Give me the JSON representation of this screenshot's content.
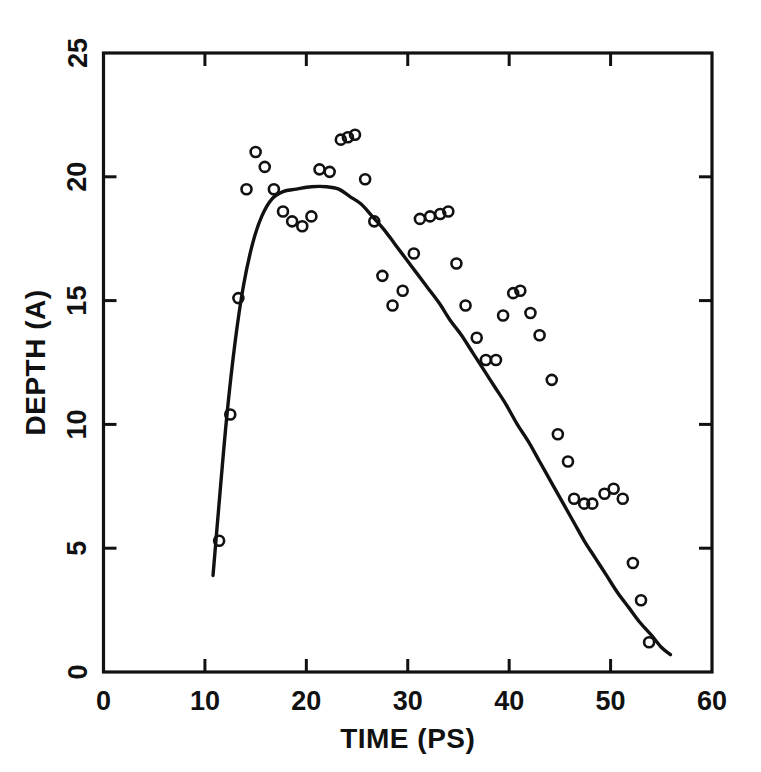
{
  "chart_data": {
    "type": "scatter",
    "title": "",
    "subtitle": "",
    "xlabel": "TIME (PS)",
    "ylabel": "DEPTH (A)",
    "xlim": [
      0,
      60
    ],
    "ylim": [
      0,
      25
    ],
    "xticks": [
      0,
      10,
      20,
      30,
      40,
      50,
      60
    ],
    "xtick_labels": [
      "0",
      "10",
      "20",
      "30",
      "40",
      "50",
      "60"
    ],
    "yticks": [
      0,
      5,
      10,
      15,
      20,
      25
    ],
    "ytick_labels": [
      "0",
      "5",
      "10",
      "15",
      "20",
      "25"
    ],
    "grid": false,
    "legend": null,
    "frame": "box",
    "tick_direction": "in",
    "marker": "open-circle",
    "series": [
      {
        "name": "measured depth",
        "type": "scatter",
        "marker": "open-circle",
        "points": [
          [
            11.4,
            5.3
          ],
          [
            12.5,
            10.4
          ],
          [
            13.3,
            15.1
          ],
          [
            14.1,
            19.5
          ],
          [
            15.0,
            21.0
          ],
          [
            15.9,
            20.4
          ],
          [
            16.8,
            19.5
          ],
          [
            17.7,
            18.6
          ],
          [
            18.6,
            18.2
          ],
          [
            19.6,
            18.0
          ],
          [
            20.5,
            18.4
          ],
          [
            21.3,
            20.3
          ],
          [
            22.3,
            20.2
          ],
          [
            23.4,
            21.5
          ],
          [
            24.1,
            21.6
          ],
          [
            24.8,
            21.7
          ],
          [
            25.8,
            19.9
          ],
          [
            26.7,
            18.2
          ],
          [
            27.5,
            16.0
          ],
          [
            28.5,
            14.8
          ],
          [
            29.5,
            15.4
          ],
          [
            30.6,
            16.9
          ],
          [
            31.2,
            18.3
          ],
          [
            32.2,
            18.4
          ],
          [
            33.2,
            18.5
          ],
          [
            34.0,
            18.6
          ],
          [
            34.8,
            16.5
          ],
          [
            35.7,
            14.8
          ],
          [
            36.8,
            13.5
          ],
          [
            37.7,
            12.6
          ],
          [
            38.7,
            12.6
          ],
          [
            39.4,
            14.4
          ],
          [
            40.4,
            15.3
          ],
          [
            41.1,
            15.4
          ],
          [
            42.1,
            14.5
          ],
          [
            43.0,
            13.6
          ],
          [
            44.2,
            11.8
          ],
          [
            44.8,
            9.6
          ],
          [
            45.8,
            8.5
          ],
          [
            46.4,
            7.0
          ],
          [
            47.4,
            6.8
          ],
          [
            48.2,
            6.8
          ],
          [
            49.4,
            7.2
          ],
          [
            50.3,
            7.4
          ],
          [
            51.2,
            7.0
          ],
          [
            52.2,
            4.4
          ],
          [
            53.0,
            2.9
          ],
          [
            53.8,
            1.2
          ]
        ]
      },
      {
        "name": "fitted curve",
        "type": "line",
        "points": [
          [
            10.8,
            3.9
          ],
          [
            11.5,
            7.3
          ],
          [
            12.2,
            10.5
          ],
          [
            13.0,
            13.4
          ],
          [
            13.8,
            15.6
          ],
          [
            14.7,
            17.3
          ],
          [
            15.6,
            18.4
          ],
          [
            16.6,
            19.1
          ],
          [
            17.7,
            19.4
          ],
          [
            19.0,
            19.5
          ],
          [
            20.5,
            19.6
          ],
          [
            22.0,
            19.6
          ],
          [
            23.2,
            19.5
          ],
          [
            24.3,
            19.2
          ],
          [
            25.4,
            18.9
          ],
          [
            26.5,
            18.4
          ],
          [
            27.6,
            17.9
          ],
          [
            28.7,
            17.3
          ],
          [
            29.8,
            16.7
          ],
          [
            30.9,
            16.1
          ],
          [
            32.0,
            15.5
          ],
          [
            33.1,
            14.9
          ],
          [
            34.2,
            14.2
          ],
          [
            35.3,
            13.6
          ],
          [
            36.4,
            12.9
          ],
          [
            37.5,
            12.2
          ],
          [
            38.6,
            11.5
          ],
          [
            39.7,
            10.8
          ],
          [
            40.8,
            10.0
          ],
          [
            41.9,
            9.3
          ],
          [
            43.0,
            8.5
          ],
          [
            44.1,
            7.7
          ],
          [
            45.2,
            6.9
          ],
          [
            46.3,
            6.1
          ],
          [
            47.4,
            5.3
          ],
          [
            48.5,
            4.6
          ],
          [
            49.6,
            3.9
          ],
          [
            50.7,
            3.2
          ],
          [
            51.8,
            2.6
          ],
          [
            52.9,
            2.0
          ],
          [
            54.0,
            1.5
          ],
          [
            55.0,
            1.0
          ],
          [
            55.9,
            0.7
          ]
        ]
      }
    ]
  }
}
